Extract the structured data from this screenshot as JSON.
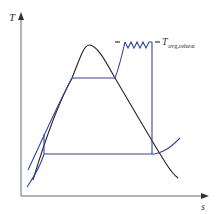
{
  "diagram": {
    "type": "T-s diagram, Rankine cycle with reheat",
    "axes": {
      "y_label": "T",
      "x_label": "s"
    },
    "annotation": {
      "prefix": "T",
      "subscript": "avg,reheat"
    },
    "colors": {
      "cycle": "#2f45a8",
      "dome": "#222222",
      "axis": "#6b6b6b"
    }
  }
}
